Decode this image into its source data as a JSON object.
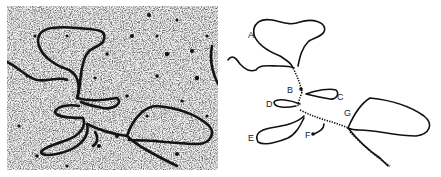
{
  "figure": {
    "left_panel": {
      "type": "electron-micrograph",
      "description": "DNA molecule with multiple loops"
    },
    "right_panel": {
      "type": "tracing",
      "labels": [
        {
          "id": "A",
          "text": "A"
        },
        {
          "id": "B",
          "text": "B"
        },
        {
          "id": "C",
          "text": "C"
        },
        {
          "id": "D",
          "text": "D"
        },
        {
          "id": "E",
          "text": "E"
        },
        {
          "id": "F",
          "text": "F"
        },
        {
          "id": "G",
          "text": "G"
        }
      ]
    },
    "colors": {
      "strand": "#111111",
      "background": "#ffffff",
      "micrograph_bg": "#d9d9d9"
    }
  }
}
